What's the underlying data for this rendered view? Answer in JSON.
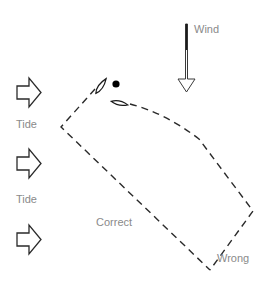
{
  "diagram": {
    "colors": {
      "line": "#2a2a2a",
      "label": "#8a8a8a",
      "background": "#ffffff"
    },
    "labels": {
      "wind": "Wind",
      "tide_1": "Tide",
      "tide_2": "Tide",
      "correct": "Correct",
      "wrong": "Wrong"
    },
    "elements": {
      "wind_arrow": "wind-arrow pointing down",
      "tide_arrows": 3,
      "boats": 2,
      "mark": "black circle mark"
    }
  }
}
